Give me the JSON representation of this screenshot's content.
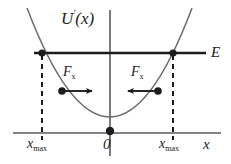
{
  "figure": {
    "kind": "potential-energy-diagram",
    "background_color": "#ffffff",
    "ink_color": "#1c1c1c",
    "axis_color": "#5a5a5a",
    "curve_color": "#6b6b6b",
    "labels": {
      "potential_curve": "U",
      "potential_curve_super": "'",
      "potential_curve_arg": "(x)",
      "energy_level": "E",
      "force_left": "F",
      "force_left_sub": "x",
      "force_right": "F",
      "force_right_sub": "x",
      "origin": "0",
      "turning_point_left": "x",
      "turning_point_left_sub": "max",
      "turning_point_right": "x",
      "turning_point_right_sub": "max",
      "x_axis": "x"
    },
    "geometry": {
      "x_axis": {
        "y": 133,
        "x_start": 13,
        "x_end": 221
      },
      "y_axis": {
        "x": 110,
        "y_start": 10,
        "y_end": 156
      },
      "energy_line": {
        "y": 53,
        "x_start": 34,
        "x_end": 206
      },
      "parabola": {
        "vertex_x": 110,
        "vertex_y": 131,
        "left_top_x": 27,
        "right_top_x": 192,
        "top_y": 8
      },
      "turning_points": [
        {
          "x": 42,
          "y": 53
        },
        {
          "x": 173,
          "y": 53
        }
      ],
      "dashed_drops": [
        {
          "x": 42,
          "y_top": 53,
          "y_bottom": 140
        },
        {
          "x": 173,
          "y_top": 53,
          "y_bottom": 140
        }
      ],
      "origin_dot": {
        "x": 110,
        "y": 131
      },
      "force_vectors": [
        {
          "name": "left",
          "dot_x": 62,
          "dot_y": 91,
          "tip_x": 97,
          "direction": "right"
        },
        {
          "name": "right",
          "dot_x": 158,
          "dot_y": 91,
          "tip_x": 123,
          "direction": "left"
        }
      ]
    }
  }
}
